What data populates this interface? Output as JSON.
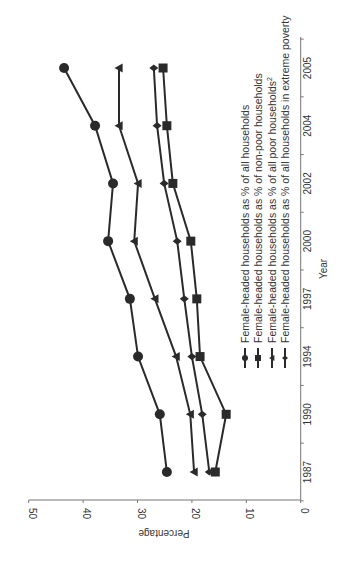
{
  "chart_data": {
    "type": "line",
    "orientation": "rotated-90-clockwise",
    "title": "",
    "xlabel": "Year",
    "ylabel": "Percentage",
    "ylim": [
      0,
      50
    ],
    "yticks": [
      0,
      10,
      20,
      30,
      40,
      50
    ],
    "categories": [
      "1987",
      "1990",
      "1994",
      "1997",
      "2000",
      "2002",
      "2004",
      "2005"
    ],
    "grid": false,
    "legend_position": "inside, near value axis",
    "series": [
      {
        "name": "Female-headed households as % of all households",
        "marker": "circle",
        "values": [
          24.6,
          25.9,
          29.9,
          31.4,
          35.4,
          34.5,
          37.8,
          43.5
        ]
      },
      {
        "name": "Female-headed households as % of non-poor households",
        "marker": "square",
        "values": [
          15.7,
          13.7,
          18.5,
          19.1,
          20.2,
          23.5,
          24.6,
          25.3
        ]
      },
      {
        "name": "Female-headed households as % of all poor households",
        "superscript": "2",
        "marker": "triangle",
        "values": [
          19.6,
          20.3,
          22.9,
          26.8,
          30.6,
          29.9,
          33.4,
          33.4
        ]
      },
      {
        "name": "Female-headed households as % of all households in extreme poverty",
        "marker": "diamond",
        "values": [
          16.8,
          18.1,
          20.0,
          21.4,
          22.7,
          25.1,
          26.4,
          27.0
        ]
      }
    ]
  }
}
